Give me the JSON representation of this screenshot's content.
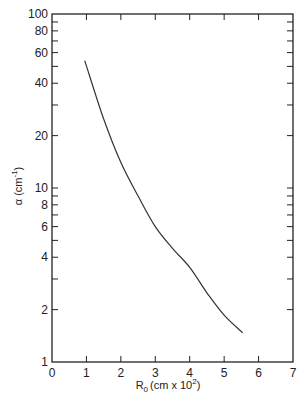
{
  "chart_data": {
    "type": "line",
    "title": "",
    "xlabel": "R₀ (cm x 10²)",
    "xlabel_main": "R",
    "xlabel_sub": "0",
    "xlabel_rest": "(cm x 10",
    "xlabel_sup": "2",
    "xlabel_end": ")",
    "ylabel": "α (cm⁻¹)",
    "ylabel_main": "α (cm",
    "ylabel_sup": "-1",
    "ylabel_end": ")",
    "xlim": [
      0,
      7
    ],
    "ylim": [
      1,
      100
    ],
    "yscale": "log",
    "grid": false,
    "legend": null,
    "x_ticks": [
      0,
      1,
      2,
      3,
      4,
      5,
      6,
      7
    ],
    "x_tick_labels": [
      "0",
      "1",
      "2",
      "3",
      "4",
      "5",
      "6",
      "7"
    ],
    "y_ticks": [
      1,
      2,
      4,
      6,
      8,
      10,
      20,
      40,
      60,
      80,
      100
    ],
    "y_tick_labels": [
      "1",
      "2",
      "4",
      "6",
      "8",
      "10",
      "20",
      "40",
      "60",
      "80",
      "100"
    ],
    "y_minor_ticks": [
      3,
      5,
      7,
      9,
      30,
      50,
      70,
      90
    ],
    "series": [
      {
        "name": "alpha vs R0",
        "color": "#333333",
        "x": [
          0.95,
          1.5,
          2.0,
          2.5,
          3.0,
          3.5,
          4.0,
          4.5,
          5.0,
          5.54
        ],
        "y": [
          54,
          25,
          14,
          9.0,
          6.0,
          4.5,
          3.5,
          2.5,
          1.86,
          1.47
        ]
      }
    ]
  }
}
